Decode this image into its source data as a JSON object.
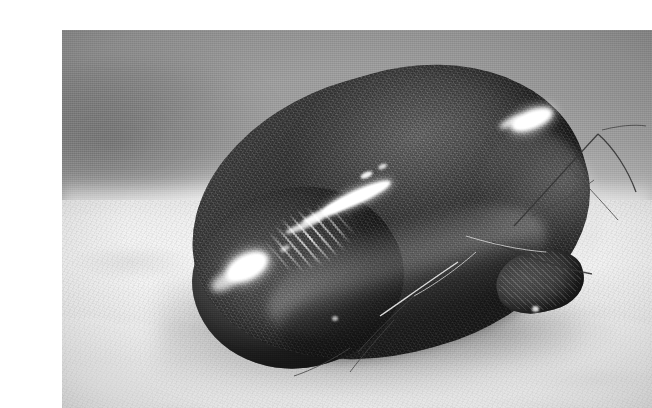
{
  "image": {
    "kind": "photograph",
    "rendering": "black-and-white grayscale photograph",
    "caption": "",
    "alt_text": "Close-up black and white photograph of a fully engorged tick resting on a pale granular surface, its glossy bean-shaped body reflecting bright specular highlights, with thin legs and setae extending to the right.",
    "plate": {
      "left": 22,
      "top": 14,
      "width": 590,
      "height": 378,
      "border": "none",
      "page_background": "#ffffff"
    }
  },
  "subject": {
    "name": "engorged-tick",
    "label": "Engorged tick",
    "description": "Blood-engorged, kidney-bean shaped arthropod body with a glossy cuticle",
    "orientation": "body long axis running lower-left to upper-right, tilted about -16 degrees",
    "parts": [
      {
        "name": "idiosoma",
        "label": "Engorged body (idiosoma)"
      },
      {
        "name": "ventral-fold",
        "label": "Ventral fold crease"
      },
      {
        "name": "posterior-lobe",
        "label": "Rounded posterior lobe"
      },
      {
        "name": "capitulum",
        "label": "Capitulum / mouthpart end"
      },
      {
        "name": "legs",
        "label": "Legs and setae"
      }
    ]
  },
  "scene": {
    "background": {
      "label": "Out-of-focus studio backdrop",
      "top_tone": "#9a9a9a",
      "horizon_tone": "#e6e6e6",
      "smudge": "dark blurred patch at upper left"
    },
    "substrate": {
      "label": "Pale granular substrate",
      "tone": "#ececec",
      "texture": "fine mottled grain with shallow ripples"
    },
    "shadow": {
      "label": "Contact shadow beneath body",
      "tone": "#2a2a2a"
    },
    "lighting": {
      "label": "Strong directional key light from upper left",
      "highlight_color": "#ffffff"
    }
  },
  "palette": {
    "paper_white": "#ffffff",
    "backdrop_gray": "#9a9a9a",
    "substrate_light": "#ececec",
    "body_mid": "#4d4d4d",
    "body_dark": "#2e2e2e",
    "body_light": "#6e6e6e",
    "specular_white": "#ffffff",
    "shadow_black": "#2a2a2a"
  },
  "highlights": [
    {
      "name": "dorsal-highlight-right",
      "label": "Bright specular blob on upper right dorsum"
    },
    {
      "name": "flank-streak",
      "label": "Elongated specular streak along upper left flank"
    },
    {
      "name": "hatched-glints",
      "label": "Field of fine dashed glints on left flank"
    },
    {
      "name": "lower-left-patch",
      "label": "Soft white patch on lower left curve"
    }
  ],
  "legs": [
    {
      "name": "leg-upper-right",
      "label": "Long foreleg sweeping up and right"
    },
    {
      "name": "leg-right-outer",
      "label": "Outer leg arcing to the right edge"
    },
    {
      "name": "leg-lower-right",
      "label": "Leg angling down and right across substrate"
    },
    {
      "name": "leg-lower-left",
      "label": "Leg trailing down and left below the body"
    },
    {
      "name": "setae-cluster",
      "label": "Cluster of fine setae near the capitulum"
    }
  ]
}
